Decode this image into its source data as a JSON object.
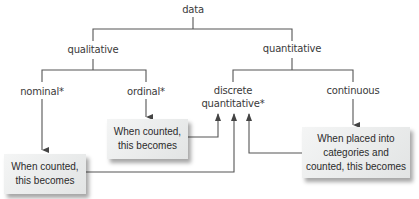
{
  "diagram": {
    "root": "data",
    "level1": {
      "left": "qualitative",
      "right": "quantitative"
    },
    "level2": {
      "nominal": "nominal*",
      "ordinal": "ordinal*",
      "discrete_line1": "discrete",
      "discrete_line2": "quantitative*",
      "continuous": "continuous"
    },
    "boxes": {
      "ordinal_box": {
        "line1": "When counted,",
        "line2": "this becomes"
      },
      "nominal_box": {
        "line1": "When counted,",
        "line2": "this becomes"
      },
      "continuous_box": {
        "line1": "When placed into",
        "line2": "categories and",
        "line3": "counted, this becomes"
      }
    },
    "colors": {
      "line": "#555555",
      "box_bg": "#e8eaea",
      "text": "#3a3a3a"
    }
  }
}
